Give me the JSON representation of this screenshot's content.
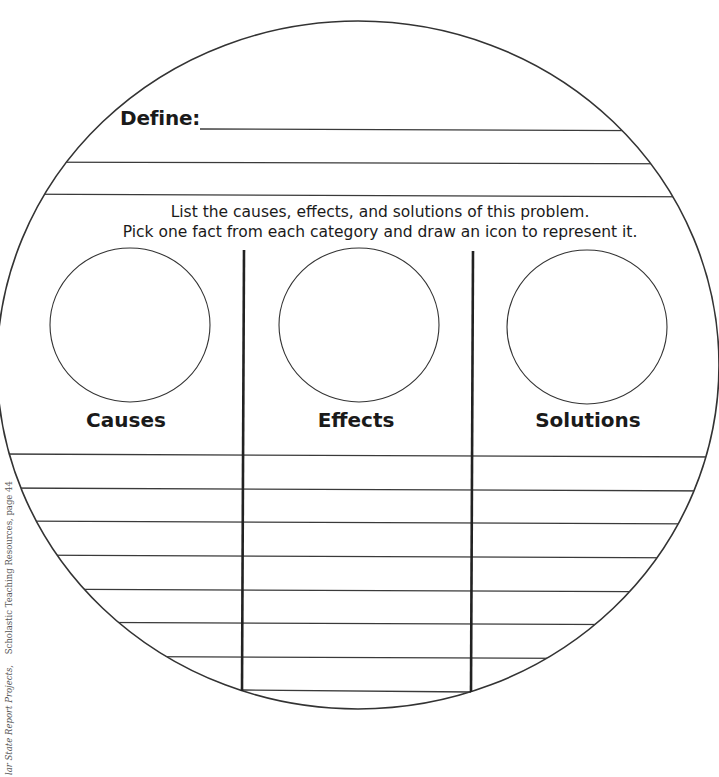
{
  "worksheet": {
    "define": {
      "label": "Define:",
      "value": "",
      "extra_lines": 2
    },
    "instructions": {
      "line1": "List the causes, effects, and solutions of this problem.",
      "line2": "Pick one fact from each category and draw an icon to represent it."
    },
    "categories": [
      {
        "label": "Causes",
        "icon_area": "empty drawing circle"
      },
      {
        "label": "Effects",
        "icon_area": "empty drawing circle"
      },
      {
        "label": "Solutions",
        "icon_area": "empty drawing circle"
      }
    ],
    "answer_lines_per_column": 7
  },
  "footer": {
    "credit_title": "lar State Report Projects,",
    "credit_source": "Scholastic Teaching Resources, page 44"
  },
  "colors": {
    "ink": "#1a1a1a",
    "line": "#333333",
    "background": "#ffffff"
  }
}
